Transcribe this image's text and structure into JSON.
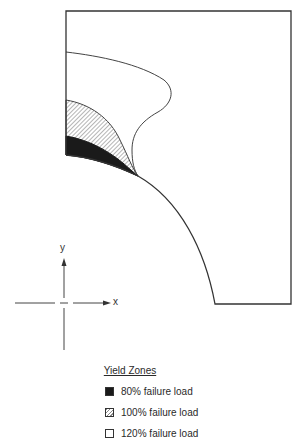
{
  "figure": {
    "type": "yield-zone-diagram"
  },
  "axes": {
    "x_label": "x",
    "y_label": "y"
  },
  "legend": {
    "title": "Yield Zones",
    "items": [
      {
        "label": "80% failure load",
        "fill": "solid-black",
        "color": "#1a1a1a"
      },
      {
        "label": "100% failure load",
        "fill": "hatched",
        "color": "#888888"
      },
      {
        "label": "120% failure load",
        "fill": "white",
        "color": "#ffffff"
      }
    ]
  },
  "colors": {
    "line": "#333333",
    "background": "#ffffff"
  }
}
